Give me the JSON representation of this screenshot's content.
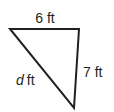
{
  "diagram": {
    "shape": "right triangle",
    "sides": {
      "top": {
        "value": "6",
        "unit": "ft",
        "label": "6 ft"
      },
      "right": {
        "value": "7",
        "unit": "ft",
        "label": "7 ft"
      },
      "hypotenuse": {
        "variable": "d",
        "unit": "ft"
      }
    },
    "stroke_color": "#231f20"
  }
}
